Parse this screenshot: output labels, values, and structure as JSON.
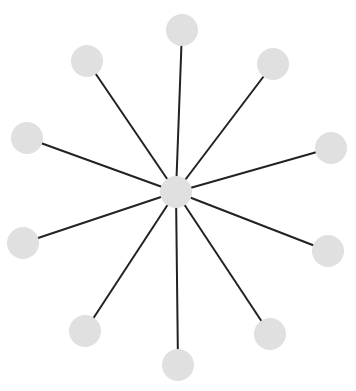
{
  "diagram": {
    "type": "star-graph",
    "width": 356,
    "height": 391,
    "colors": {
      "background": "#ffffff",
      "node_fill": "#e0e0e0",
      "edge_stroke": "#222222"
    },
    "node_radius": 16,
    "edge_width": 2,
    "hub": {
      "id": "center",
      "x": 176,
      "y": 192
    },
    "leaves": [
      {
        "id": "n-top",
        "x": 182,
        "y": 30
      },
      {
        "id": "n-top-right",
        "x": 273,
        "y": 64
      },
      {
        "id": "n-right-upper",
        "x": 331,
        "y": 148
      },
      {
        "id": "n-right-lower",
        "x": 328,
        "y": 251
      },
      {
        "id": "n-bottom-right",
        "x": 270,
        "y": 334
      },
      {
        "id": "n-bottom",
        "x": 178,
        "y": 365
      },
      {
        "id": "n-bottom-left",
        "x": 85,
        "y": 331
      },
      {
        "id": "n-left-lower",
        "x": 23,
        "y": 243
      },
      {
        "id": "n-left-upper",
        "x": 27,
        "y": 138
      },
      {
        "id": "n-top-left",
        "x": 87,
        "y": 61
      }
    ]
  }
}
